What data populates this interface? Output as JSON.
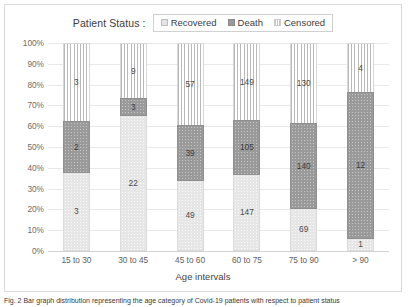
{
  "legend": {
    "title": "Patient Status :",
    "items": [
      {
        "label": "Recovered",
        "swatch": "recovered-swatch-icon",
        "color": "#e6e6e6"
      },
      {
        "label": "Death",
        "swatch": "death-swatch-icon",
        "color": "#9a9a9a"
      },
      {
        "label": "Censored",
        "swatch": "censored-swatch-icon",
        "color": "#ffffff"
      }
    ]
  },
  "axes": {
    "xlabel": "Age intervals",
    "ylabel": "",
    "yticks": [
      "100%",
      "90%",
      "80%",
      "70%",
      "60%",
      "50%",
      "40%",
      "30%",
      "20%",
      "10%",
      "0%"
    ]
  },
  "caption": {
    "text": "Fig. 2  Bar graph distribution representing the age category of Covid-19 patients with respect to patient status"
  },
  "chart_data": {
    "type": "bar",
    "stacked": true,
    "normalized": "100%",
    "title": "",
    "xlabel": "Age intervals",
    "ylabel": "",
    "ylim": [
      0,
      100
    ],
    "grid": true,
    "legend_position": "top-center",
    "categories": [
      "15 to 30",
      "30 to 45",
      "45 to 60",
      "60 to 75",
      "75 to 90",
      "> 90"
    ],
    "series": [
      {
        "name": "Recovered",
        "values": [
          3,
          22,
          49,
          147,
          69,
          1
        ],
        "percents": [
          37.5,
          64.7,
          33.8,
          36.6,
          20.4,
          5.9
        ]
      },
      {
        "name": "Death",
        "values": [
          2,
          3,
          39,
          105,
          140,
          12
        ],
        "percents": [
          25.0,
          8.8,
          26.9,
          26.2,
          41.3,
          70.6
        ]
      },
      {
        "name": "Censored",
        "values": [
          3,
          9,
          57,
          149,
          130,
          4
        ],
        "percents": [
          37.5,
          26.5,
          39.3,
          37.2,
          38.3,
          23.5
        ]
      }
    ]
  }
}
